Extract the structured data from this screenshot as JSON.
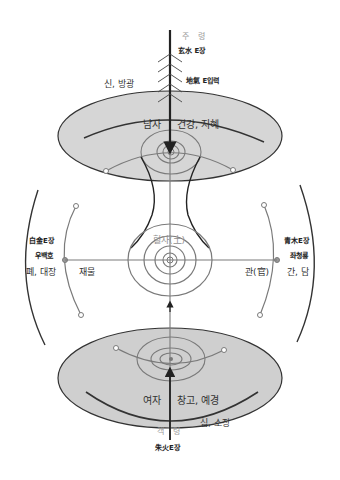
{
  "diagram": {
    "colors": {
      "ellipse_fill": "#cfcfcf",
      "ellipse_fill_top": "#d6d6d6",
      "stroke_dark": "#333333",
      "stroke_gray": "#7a7a7a",
      "label_gray": "#9a9a9a",
      "label_dark": "#333333"
    },
    "top": {
      "direction": "주 령",
      "energy_source": "玄水 E장",
      "input": "地氣 E입력",
      "left_label": "신, 방광",
      "ellipse_label_left": "남자",
      "ellipse_label_right": "건강, 지혜"
    },
    "center": {
      "label": "혈자(土)"
    },
    "left": {
      "energy_source": "白金E장",
      "guardian": "우백호",
      "organs": "폐, 대장",
      "attribute": "재물"
    },
    "right": {
      "energy_source": "青木E장",
      "guardian": "좌청룡",
      "organs": "간, 담",
      "attribute": "관(官)"
    },
    "bottom": {
      "ellipse_label_left": "여자",
      "ellipse_label_right": "창고, 예경",
      "right_label": "심, 소장",
      "direction": "객 령",
      "energy_source": "朱火E장"
    }
  }
}
